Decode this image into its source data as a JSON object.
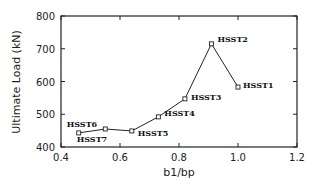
{
  "chart_data": {
    "type": "line",
    "title": "",
    "xlabel": "b1/bp",
    "ylabel": "Ultimate Load (kN)",
    "xlim": [
      0.4,
      1.2
    ],
    "ylim": [
      400,
      800
    ],
    "xticks": [
      "0.4",
      "0.6",
      "0.8",
      "1.0",
      "1.2"
    ],
    "yticks": [
      "400",
      "500",
      "600",
      "700",
      "800"
    ],
    "grid": false,
    "legend": null,
    "series": [
      {
        "name": "HSST specimens",
        "marker": "open-square",
        "points": [
          {
            "label": "HSST7",
            "x": 0.46,
            "y": 443
          },
          {
            "label": "HSST6",
            "x": 0.55,
            "y": 455
          },
          {
            "label": "HSST5",
            "x": 0.64,
            "y": 449
          },
          {
            "label": "HSST4",
            "x": 0.73,
            "y": 492
          },
          {
            "label": "HSST3",
            "x": 0.82,
            "y": 547
          },
          {
            "label": "HSST2",
            "x": 0.91,
            "y": 715
          },
          {
            "label": "HSST1",
            "x": 1.0,
            "y": 583
          }
        ]
      }
    ]
  }
}
